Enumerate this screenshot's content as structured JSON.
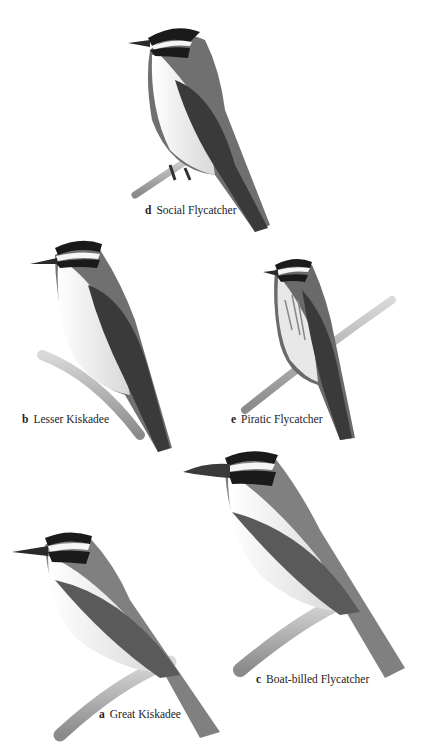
{
  "plate": {
    "birds": [
      {
        "letter": "d",
        "name": "Social Flycatcher"
      },
      {
        "letter": "b",
        "name": "Lesser Kiskadee"
      },
      {
        "letter": "e",
        "name": "Piratic Flycatcher"
      },
      {
        "letter": "c",
        "name": "Boat-billed Flycatcher"
      },
      {
        "letter": "a",
        "name": "Great Kiskadee"
      }
    ]
  },
  "colors": {
    "background": "#ffffff",
    "cap": "#1a1a1a",
    "back": "#6e6e6e",
    "wing": "#3c3c3c",
    "belly": "#f2f2f2",
    "branch": "#b5b5b5"
  }
}
